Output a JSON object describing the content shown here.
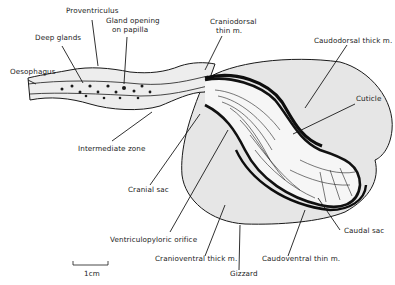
{
  "diagram": {
    "labels": {
      "proventriculus": "Proventriculus",
      "gland_opening_1": "Gland opening",
      "gland_opening_2": "on papilla",
      "deep_glands": "Deep glands",
      "oesophagus": "Oesophagus",
      "craniodorsal_1": "Craniodorsal",
      "craniodorsal_2": "thin m.",
      "caudodorsal": "Caudodorsal thick m.",
      "cuticle": "Cuticle",
      "intermediate_zone": "Intermediate zone",
      "cranial_sac": "Cranial sac",
      "caudal_sac": "Caudal sac",
      "ventriculopyloric": "Ventriculopyloric orifice",
      "cranioventral": "Cranioventral thick m.",
      "caudoventral": "Caudoventral thin m.",
      "gizzard": "Gizzard",
      "scale": "1cm"
    },
    "colors": {
      "ink": "#1a1a1a",
      "fill": "#e4e4e4",
      "background": "#ffffff"
    }
  }
}
